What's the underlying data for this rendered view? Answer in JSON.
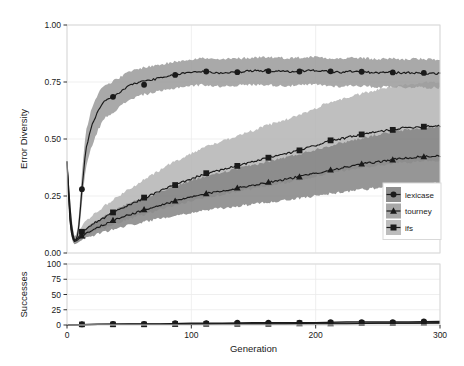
{
  "figure": {
    "background": "#ffffff",
    "panel_background": "#ffffff",
    "panel_border": "#d9d9d9",
    "gridline_color": "#ebebeb"
  },
  "chart_data": {
    "type": "line",
    "title": "",
    "subtitle": "",
    "panels": [
      {
        "name": "error-diversity-panel",
        "ylabel": "Error Diversity",
        "xlabel": "",
        "ylim": [
          0.0,
          1.0
        ],
        "xlim": [
          0,
          300
        ],
        "ytick_labels": [
          "0.00",
          "0.25",
          "0.50",
          "0.75",
          "1.00"
        ],
        "ytick_values": [
          0.0,
          0.25,
          0.5,
          0.75,
          1.0
        ],
        "xtick_labels": [
          "0",
          "100",
          "200",
          "300"
        ],
        "xtick_values": [
          0,
          100,
          200,
          300
        ],
        "grid": true,
        "ribbon_opacity": "0.5",
        "series": [
          {
            "name": "lexicase",
            "marker": "circle",
            "line_color": "#1a1a1a",
            "ribbon_color": "#9a9a9a",
            "x": [
              0,
              2,
              4,
              6,
              8,
              10,
              12,
              15,
              20,
              25,
              30,
              40,
              50,
              60,
              70,
              80,
              90,
              100,
              110,
              120,
              130,
              140,
              150,
              160,
              170,
              180,
              190,
              200,
              210,
              220,
              230,
              240,
              250,
              260,
              270,
              280,
              290,
              300
            ],
            "values": [
              0.4,
              0.23,
              0.1,
              0.055,
              0.06,
              0.14,
              0.28,
              0.45,
              0.56,
              0.62,
              0.665,
              0.695,
              0.735,
              0.752,
              0.762,
              0.772,
              0.785,
              0.793,
              0.797,
              0.789,
              0.792,
              0.795,
              0.799,
              0.8,
              0.797,
              0.795,
              0.799,
              0.801,
              0.796,
              0.792,
              0.797,
              0.793,
              0.79,
              0.793,
              0.789,
              0.791,
              0.788,
              0.787
            ],
            "lower": [
              0.4,
              0.2,
              0.08,
              0.04,
              0.045,
              0.1,
              0.22,
              0.37,
              0.47,
              0.54,
              0.59,
              0.63,
              0.672,
              0.693,
              0.704,
              0.714,
              0.727,
              0.733,
              0.738,
              0.73,
              0.733,
              0.736,
              0.738,
              0.738,
              0.734,
              0.733,
              0.736,
              0.739,
              0.733,
              0.73,
              0.735,
              0.731,
              0.727,
              0.731,
              0.726,
              0.728,
              0.726,
              0.724
            ],
            "upper": [
              0.4,
              0.27,
              0.13,
              0.075,
              0.08,
              0.19,
              0.35,
              0.53,
              0.64,
              0.7,
              0.735,
              0.762,
              0.795,
              0.812,
              0.822,
              0.831,
              0.843,
              0.851,
              0.855,
              0.848,
              0.851,
              0.854,
              0.858,
              0.86,
              0.857,
              0.855,
              0.858,
              0.861,
              0.856,
              0.852,
              0.857,
              0.854,
              0.85,
              0.854,
              0.849,
              0.852,
              0.849,
              0.848
            ],
            "markers_x": [
              12,
              37,
              62,
              87,
              112,
              137,
              162,
              187,
              212,
              237,
              262,
              287
            ],
            "markers_y": [
              0.28,
              0.685,
              0.738,
              0.781,
              0.796,
              0.793,
              0.798,
              0.796,
              0.797,
              0.795,
              0.792,
              0.79
            ]
          },
          {
            "name": "ifs",
            "marker": "square",
            "line_color": "#1a1a1a",
            "ribbon_color": "#b4b4b4",
            "x": [
              0,
              2,
              4,
              6,
              8,
              10,
              15,
              20,
              30,
              40,
              50,
              60,
              70,
              80,
              90,
              100,
              110,
              120,
              130,
              140,
              150,
              160,
              170,
              180,
              190,
              200,
              210,
              220,
              230,
              240,
              250,
              260,
              270,
              280,
              290,
              300
            ],
            "values": [
              0.4,
              0.18,
              0.08,
              0.055,
              0.06,
              0.075,
              0.105,
              0.125,
              0.155,
              0.185,
              0.21,
              0.235,
              0.26,
              0.285,
              0.305,
              0.325,
              0.345,
              0.358,
              0.372,
              0.388,
              0.4,
              0.415,
              0.428,
              0.44,
              0.455,
              0.472,
              0.49,
              0.5,
              0.512,
              0.522,
              0.532,
              0.54,
              0.548,
              0.552,
              0.557,
              0.558
            ],
            "lower": [
              0.4,
              0.15,
              0.06,
              0.04,
              0.045,
              0.055,
              0.075,
              0.09,
              0.11,
              0.13,
              0.148,
              0.165,
              0.182,
              0.2,
              0.213,
              0.228,
              0.242,
              0.252,
              0.262,
              0.274,
              0.282,
              0.293,
              0.303,
              0.312,
              0.324,
              0.337,
              0.35,
              0.358,
              0.368,
              0.376,
              0.384,
              0.39,
              0.397,
              0.4,
              0.404,
              0.405
            ],
            "upper": [
              0.4,
              0.21,
              0.1,
              0.072,
              0.08,
              0.1,
              0.14,
              0.165,
              0.205,
              0.245,
              0.28,
              0.315,
              0.348,
              0.382,
              0.41,
              0.437,
              0.464,
              0.482,
              0.5,
              0.522,
              0.538,
              0.558,
              0.575,
              0.592,
              0.612,
              0.635,
              0.66,
              0.673,
              0.689,
              0.702,
              0.716,
              0.727,
              0.738,
              0.743,
              0.75,
              0.752
            ],
            "markers_x": [
              12,
              37,
              62,
              87,
              112,
              137,
              162,
              187,
              212,
              237,
              262,
              287
            ],
            "markers_y": [
              0.093,
              0.178,
              0.243,
              0.298,
              0.35,
              0.382,
              0.418,
              0.45,
              0.494,
              0.52,
              0.54,
              0.554
            ]
          },
          {
            "name": "tourney",
            "marker": "triangle",
            "line_color": "#1a1a1a",
            "ribbon_color": "#848484",
            "x": [
              0,
              2,
              4,
              6,
              8,
              10,
              15,
              20,
              30,
              40,
              50,
              60,
              70,
              80,
              90,
              100,
              110,
              120,
              130,
              140,
              150,
              160,
              170,
              180,
              190,
              200,
              210,
              220,
              230,
              240,
              250,
              260,
              270,
              280,
              290,
              300
            ],
            "values": [
              0.4,
              0.16,
              0.07,
              0.05,
              0.055,
              0.065,
              0.085,
              0.1,
              0.125,
              0.148,
              0.168,
              0.185,
              0.2,
              0.218,
              0.232,
              0.245,
              0.258,
              0.268,
              0.278,
              0.288,
              0.298,
              0.308,
              0.318,
              0.328,
              0.338,
              0.35,
              0.362,
              0.372,
              0.382,
              0.392,
              0.4,
              0.408,
              0.415,
              0.42,
              0.424,
              0.426
            ],
            "lower": [
              0.4,
              0.135,
              0.055,
              0.038,
              0.042,
              0.05,
              0.065,
              0.075,
              0.092,
              0.108,
              0.122,
              0.134,
              0.145,
              0.158,
              0.168,
              0.177,
              0.186,
              0.193,
              0.2,
              0.207,
              0.214,
              0.221,
              0.228,
              0.235,
              0.242,
              0.251,
              0.259,
              0.266,
              0.273,
              0.28,
              0.285,
              0.291,
              0.296,
              0.3,
              0.303,
              0.304
            ],
            "upper": [
              0.4,
              0.185,
              0.085,
              0.063,
              0.068,
              0.082,
              0.107,
              0.127,
              0.16,
              0.19,
              0.216,
              0.238,
              0.258,
              0.281,
              0.3,
              0.317,
              0.334,
              0.347,
              0.36,
              0.373,
              0.386,
              0.399,
              0.412,
              0.425,
              0.438,
              0.454,
              0.469,
              0.482,
              0.495,
              0.508,
              0.519,
              0.529,
              0.538,
              0.545,
              0.55,
              0.553
            ],
            "markers_x": [
              12,
              37,
              62,
              87,
              112,
              137,
              162,
              187,
              212,
              237,
              262,
              287
            ],
            "markers_y": [
              0.075,
              0.143,
              0.19,
              0.228,
              0.26,
              0.285,
              0.31,
              0.334,
              0.364,
              0.39,
              0.408,
              0.422
            ]
          }
        ]
      },
      {
        "name": "successes-panel",
        "ylabel": "Successes",
        "xlabel": "Generation",
        "ylim": [
          0,
          100
        ],
        "xlim": [
          0,
          300
        ],
        "ytick_labels": [
          "0",
          "25",
          "50",
          "75",
          "100"
        ],
        "ytick_values": [
          0,
          25,
          50,
          75,
          100
        ],
        "xtick_labels": [
          "0",
          "100",
          "200",
          "300"
        ],
        "xtick_values": [
          0,
          100,
          200,
          300
        ],
        "grid": true,
        "series": [
          {
            "name": "lexicase",
            "marker": "circle",
            "line_color": "#1a1a1a",
            "x": [
              0,
              25,
              50,
              75,
              100,
              125,
              150,
              175,
              200,
              225,
              250,
              275,
              300
            ],
            "values": [
              0,
              1,
              2,
              2,
              3,
              3,
              4,
              4,
              4,
              5,
              5,
              5,
              6
            ],
            "markers_x": [
              12,
              37,
              62,
              87,
              112,
              137,
              162,
              187,
              212,
              237,
              262,
              287
            ],
            "markers_y": [
              1,
              2,
              2,
              3,
              3,
              4,
              4,
              4,
              5,
              5,
              5,
              6
            ]
          },
          {
            "name": "ifs",
            "marker": "square",
            "line_color": "#1a1a1a",
            "x": [
              0,
              25,
              50,
              75,
              100,
              125,
              150,
              175,
              200,
              225,
              250,
              275,
              300
            ],
            "values": [
              0,
              1,
              1,
              1,
              2,
              2,
              2,
              2,
              3,
              3,
              3,
              3,
              4
            ],
            "markers_x": [
              12,
              37,
              62,
              87,
              112,
              137,
              162,
              187,
              212,
              237,
              262,
              287
            ],
            "markers_y": [
              1,
              1,
              1,
              2,
              2,
              2,
              2,
              3,
              3,
              3,
              3,
              4
            ]
          },
          {
            "name": "tourney",
            "marker": "triangle",
            "line_color": "#1a1a1a",
            "x": [
              0,
              25,
              50,
              75,
              100,
              125,
              150,
              175,
              200,
              225,
              250,
              275,
              300
            ],
            "values": [
              0,
              1,
              1,
              1,
              1,
              2,
              2,
              2,
              2,
              2,
              3,
              3,
              3
            ],
            "markers_x": [
              12,
              37,
              62,
              87,
              112,
              137,
              162,
              187,
              212,
              237,
              262,
              287
            ],
            "markers_y": [
              1,
              1,
              1,
              1,
              2,
              2,
              2,
              2,
              2,
              3,
              3,
              3
            ]
          }
        ]
      }
    ],
    "legend": {
      "position": "bottom-right-inside",
      "background": "#d2d2d2",
      "border": "#d9d9d9",
      "entries": [
        {
          "label": "lexicase",
          "marker": "circle",
          "key_background": "#8f8f8f"
        },
        {
          "label": "tourney",
          "marker": "triangle",
          "key_background": "#a8a8a8"
        },
        {
          "label": "ifs",
          "marker": "square",
          "key_background": "#bdbdbd"
        }
      ]
    }
  }
}
